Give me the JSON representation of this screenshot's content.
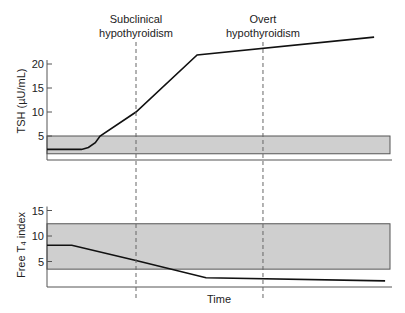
{
  "chart_data": [
    {
      "type": "line",
      "panel": "top",
      "ylabel": "TSH (µU/mL)",
      "xlabel": "",
      "xlim": [
        0,
        100
      ],
      "ylim": [
        0,
        27
      ],
      "yticks": [
        5,
        10,
        15,
        20
      ],
      "ytick_labels": [
        "5",
        "10",
        "15",
        "20"
      ],
      "reference_band": {
        "low": 1.3,
        "high": 5,
        "color": "#cfcfcf"
      },
      "series": [
        {
          "name": "TSH",
          "x": [
            0,
            10,
            12,
            14,
            15.4,
            25.8,
            43.5,
            94.8
          ],
          "y": [
            2.2,
            2.2,
            2.6,
            3.6,
            5,
            10,
            21.9,
            25.6
          ]
        }
      ],
      "grid": false
    },
    {
      "type": "line",
      "panel": "bottom",
      "ylabel": "Free T₄ index",
      "xlabel": "Time",
      "xlim": [
        0,
        100
      ],
      "ylim": [
        0,
        16
      ],
      "yticks": [
        5,
        10,
        15
      ],
      "ytick_labels": [
        "5",
        "10",
        "15"
      ],
      "reference_band": {
        "low": 3.5,
        "high": 12.4,
        "color": "#cfcfcf"
      },
      "series": [
        {
          "name": "Free T4 index",
          "x": [
            0,
            7.2,
            25.8,
            46.1,
            98
          ],
          "y": [
            8.2,
            8.2,
            5.2,
            1.8,
            1.2
          ]
        }
      ],
      "grid": false
    }
  ],
  "annotations": [
    {
      "text_lines": [
        "Subclinical",
        "hypothyroidism"
      ],
      "x": 25.8
    },
    {
      "text_lines": [
        "Overt",
        "hypothyroidism"
      ],
      "x": 62.6
    }
  ],
  "colors": {
    "band": "#cfcfcf",
    "line": "#111111",
    "axis": "#555555",
    "dashed": "#666666"
  }
}
